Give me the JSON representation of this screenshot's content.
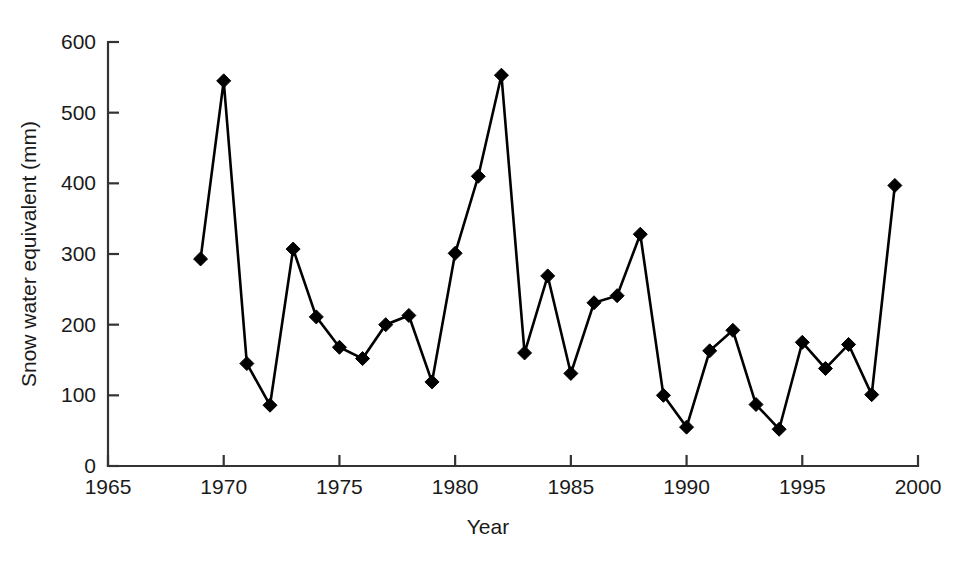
{
  "chart_data": {
    "type": "line",
    "title": "",
    "xlabel": "Year",
    "ylabel": "Snow water equivalent (mm)",
    "xlim": [
      1965,
      2000
    ],
    "ylim": [
      0,
      600
    ],
    "xticks": [
      1965,
      1970,
      1975,
      1980,
      1985,
      1990,
      1995,
      2000
    ],
    "xtick_labels": [
      "1965",
      "1970",
      "1975",
      "1980",
      "1985",
      "1990",
      "1995",
      "2000"
    ],
    "yticks": [
      0,
      100,
      200,
      300,
      400,
      500,
      600
    ],
    "ytick_labels": [
      "0",
      "100",
      "200",
      "300",
      "400",
      "500",
      "600"
    ],
    "grid": false,
    "legend": null,
    "marker": "filled-diamond",
    "line_color": "#000000",
    "marker_color": "#000000",
    "x": [
      1969,
      1970,
      1971,
      1972,
      1973,
      1974,
      1975,
      1976,
      1977,
      1978,
      1979,
      1980,
      1981,
      1982,
      1983,
      1984,
      1985,
      1986,
      1987,
      1988,
      1989,
      1990,
      1991,
      1992,
      1993,
      1994,
      1995,
      1996,
      1997,
      1998,
      1999
    ],
    "values": [
      293,
      545,
      145,
      86,
      307,
      211,
      168,
      152,
      200,
      213,
      119,
      301,
      410,
      553,
      160,
      269,
      131,
      231,
      241,
      328,
      100,
      55,
      163,
      192,
      87,
      52,
      175,
      138,
      172,
      101,
      397
    ],
    "points": [
      {
        "year": 1969,
        "swe": 293
      },
      {
        "year": 1970,
        "swe": 545
      },
      {
        "year": 1971,
        "swe": 145
      },
      {
        "year": 1972,
        "swe": 86
      },
      {
        "year": 1973,
        "swe": 307
      },
      {
        "year": 1974,
        "swe": 211
      },
      {
        "year": 1975,
        "swe": 168
      },
      {
        "year": 1976,
        "swe": 152
      },
      {
        "year": 1977,
        "swe": 200
      },
      {
        "year": 1978,
        "swe": 213
      },
      {
        "year": 1979,
        "swe": 119
      },
      {
        "year": 1980,
        "swe": 301
      },
      {
        "year": 1981,
        "swe": 410
      },
      {
        "year": 1982,
        "swe": 553
      },
      {
        "year": 1983,
        "swe": 160
      },
      {
        "year": 1984,
        "swe": 269
      },
      {
        "year": 1985,
        "swe": 131
      },
      {
        "year": 1986,
        "swe": 231
      },
      {
        "year": 1987,
        "swe": 241
      },
      {
        "year": 1988,
        "swe": 328
      },
      {
        "year": 1989,
        "swe": 100
      },
      {
        "year": 1990,
        "swe": 55
      },
      {
        "year": 1991,
        "swe": 163
      },
      {
        "year": 1992,
        "swe": 192
      },
      {
        "year": 1993,
        "swe": 87
      },
      {
        "year": 1994,
        "swe": 52
      },
      {
        "year": 1995,
        "swe": 175
      },
      {
        "year": 1996,
        "swe": 138
      },
      {
        "year": 1997,
        "swe": 172
      },
      {
        "year": 1998,
        "swe": 101
      },
      {
        "year": 1999,
        "swe": 397
      }
    ]
  }
}
